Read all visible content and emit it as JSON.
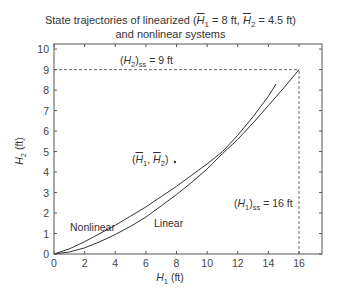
{
  "chart_data": {
    "type": "line",
    "title_line1": "State trajectories of linearized (H̄₁ = 8 ft, H̄₂ = 4.5 ft)",
    "title_line2": "and nonlinear systems",
    "xlabel": "H1 (ft)",
    "ylabel": "H2 (ft)",
    "xlim": [
      0,
      17.5
    ],
    "ylim": [
      0,
      10.25
    ],
    "xticks": [
      0,
      2,
      4,
      6,
      8,
      10,
      12,
      14,
      16
    ],
    "yticks": [
      0,
      1,
      2,
      3,
      4,
      5,
      6,
      7,
      8,
      9,
      10
    ],
    "grid": false,
    "series": [
      {
        "name": "Nonlinear",
        "x": [
          0,
          1,
          2,
          3,
          4,
          5,
          6,
          7,
          8,
          9,
          10,
          11,
          12,
          13,
          14,
          14.5
        ],
        "y": [
          0,
          0.25,
          0.6,
          1.0,
          1.4,
          1.85,
          2.3,
          2.8,
          3.3,
          3.85,
          4.4,
          5.0,
          5.8,
          6.7,
          7.7,
          8.3
        ]
      },
      {
        "name": "Linear",
        "x": [
          0,
          1,
          2,
          3,
          4,
          5,
          6,
          7,
          8,
          9,
          10,
          11,
          12,
          13,
          14,
          15,
          16
        ],
        "y": [
          0,
          0.1,
          0.3,
          0.6,
          0.95,
          1.35,
          1.8,
          2.35,
          2.9,
          3.5,
          4.15,
          4.9,
          5.6,
          6.4,
          7.25,
          8.1,
          9.0
        ]
      }
    ],
    "annotations": [
      {
        "text": "(H2)ss = 9 ft",
        "x": 6.8,
        "y": 9.35
      },
      {
        "text": "(H̄1, H̄2)",
        "x": 6.2,
        "y": 4.6,
        "marker": [
          7.9,
          4.5
        ]
      },
      {
        "text": "Nonlinear",
        "x": 1.0,
        "y": 1.25
      },
      {
        "text": "Linear",
        "x": 8.0,
        "y": 0.8
      },
      {
        "text": "(H1)ss = 16 ft",
        "x": 11.0,
        "y": 2.45
      }
    ],
    "reference_lines": [
      {
        "type": "horizontal",
        "y": 9,
        "x_from": 0,
        "x_to": 16,
        "style": "dashed"
      },
      {
        "type": "vertical",
        "x": 16,
        "y_from": 0,
        "y_to": 9,
        "style": "dashed"
      }
    ]
  },
  "labels": {
    "title_line1_pre": "State trajectories of linearized (",
    "h": "H",
    "sub1": "1",
    "sub2": "2",
    "eq8": " = 8 ft, ",
    "eq45": " = 4.5 ft)",
    "title_line2": "and nonlinear systems",
    "xlabel_unit": " (ft)",
    "ylabel_unit": " (ft)",
    "h2ss_pre": "(",
    "h2ss_post": ")",
    "ss": "ss",
    "h2ss_val": " = 9 ft",
    "h1ss_val": " = 16 ft",
    "nonlinear": "Nonlinear",
    "linear": "Linear",
    "op_open": "(",
    "op_comma": ", ",
    "op_close": ")",
    "op_marker": "•"
  }
}
